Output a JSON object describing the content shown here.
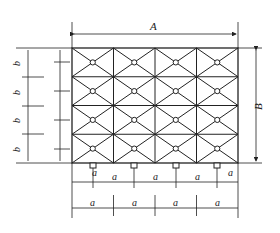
{
  "diagram": {
    "labels": {
      "A": "A",
      "B": "B",
      "b": "b",
      "a": "a",
      "half_num_b": "b",
      "half_num_a": "a",
      "half_den": "2"
    },
    "grid": {
      "columns": 4,
      "rows": 4
    },
    "colors": {
      "line": "#222222",
      "background": "#ffffff"
    }
  }
}
